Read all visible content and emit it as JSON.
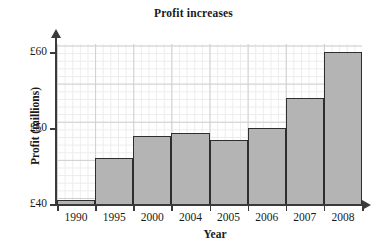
{
  "chart_data": {
    "type": "bar",
    "title": "Profit increases",
    "xlabel": "Year",
    "ylabel": "Profit (millions)",
    "categories": [
      "1990",
      "1995",
      "2000",
      "2004",
      "2005",
      "2006",
      "2007",
      "2008"
    ],
    "values": [
      40.5,
      46,
      48.9,
      49.3,
      48.4,
      50,
      54,
      60
    ],
    "ylim": [
      40,
      61.5
    ],
    "y_ticks": [
      "£40",
      "£50",
      "£60"
    ],
    "y_tick_values": [
      40,
      50,
      60
    ],
    "grid": true,
    "grid_minor": true,
    "legend": null,
    "bar_color": "#b4b4b4",
    "bar_edge_color": "#2e2e2e",
    "axis_color": "#3a3a3a",
    "grid_color": "#cfcfcf",
    "grid_minor_color": "#ececec",
    "currency_symbol": "£",
    "units": "millions"
  }
}
